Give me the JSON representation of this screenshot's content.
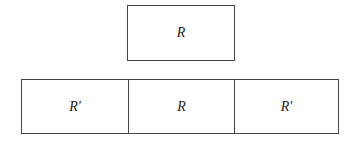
{
  "top_region": {
    "label": "R"
  },
  "bottom_row": {
    "cells": [
      {
        "label": "R′"
      },
      {
        "label": "R"
      },
      {
        "label": "R′"
      }
    ]
  }
}
